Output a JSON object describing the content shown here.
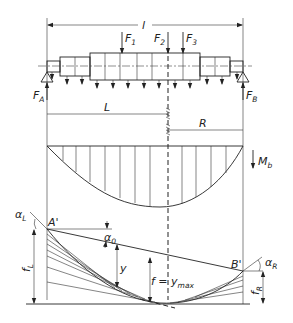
{
  "diagram": {
    "type": "beam bending / deflection diagram",
    "dimensions": {
      "total_length": "l",
      "left_segment": "L",
      "right_segment": "R"
    },
    "forces": {
      "F1": {
        "label": "F",
        "sub": "1"
      },
      "F2": {
        "label": "F",
        "sub": "2"
      },
      "F3": {
        "label": "F",
        "sub": "3"
      },
      "FA": {
        "label": "F",
        "sub": "A"
      },
      "FB": {
        "label": "F",
        "sub": "B"
      }
    },
    "moment": {
      "label": "M",
      "sub": "b"
    },
    "deflection": {
      "point_A": "A'",
      "point_B": "B'",
      "alpha_L": {
        "label": "α",
        "sub": "L"
      },
      "alpha_0": {
        "label": "α",
        "sub": "0"
      },
      "alpha_R": {
        "label": "α",
        "sub": "R"
      },
      "y": "y",
      "f_max": {
        "label": "f = y",
        "sub": "max"
      },
      "f_L": {
        "label": "f",
        "sub": "L"
      },
      "f_R": {
        "label": "f",
        "sub": "R"
      }
    }
  }
}
